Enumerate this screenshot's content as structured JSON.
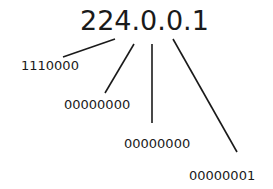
{
  "diagram": {
    "ip_address": "224.0.0.1",
    "octets_binary": [
      {
        "octet": "224",
        "binary": "1110000"
      },
      {
        "octet": "0",
        "binary": "00000000"
      },
      {
        "octet": "0",
        "binary": "00000000"
      },
      {
        "octet": "1",
        "binary": "00000001"
      }
    ],
    "line_color": "#1a1a1a"
  }
}
